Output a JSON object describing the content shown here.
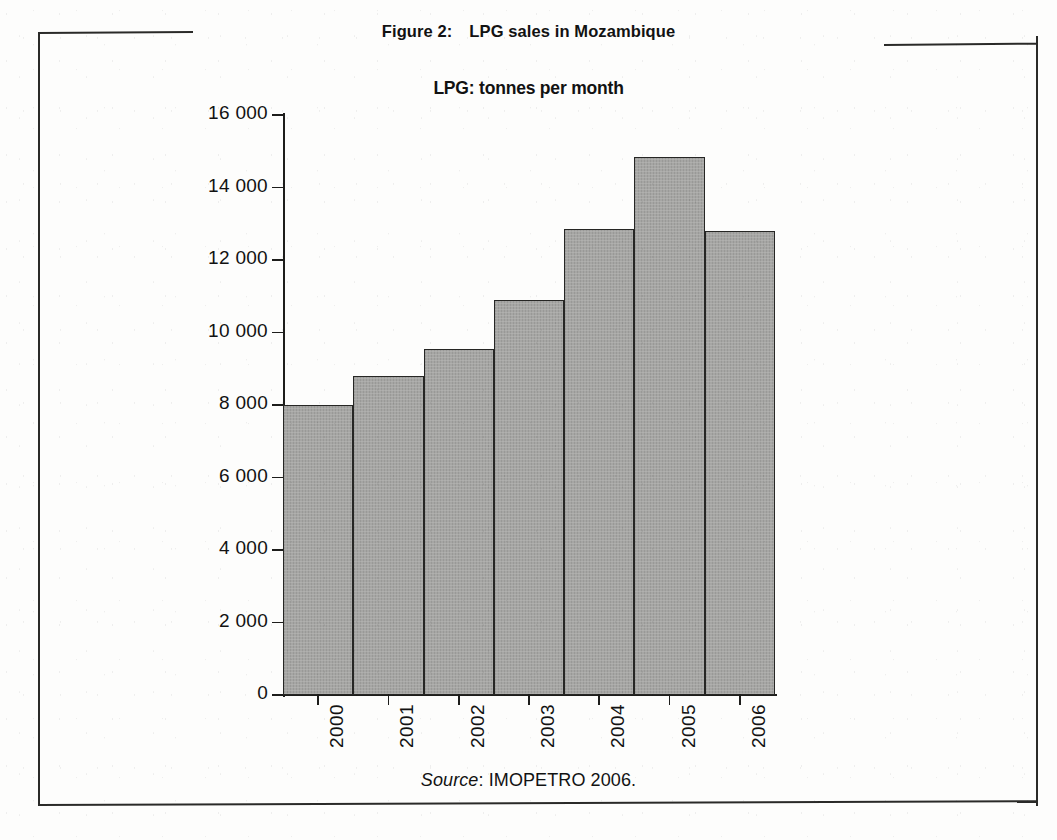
{
  "figure": {
    "number_label": "Figure 2:",
    "caption": "LPG sales in Mozambique"
  },
  "source": {
    "label": "Source",
    "text": ": IMOPETRO 2006."
  },
  "chart_data": {
    "type": "bar",
    "title": "LPG: tonnes per month",
    "xlabel": "",
    "ylabel": "",
    "categories": [
      "2000",
      "2001",
      "2002",
      "2003",
      "2004",
      "2005",
      "2006"
    ],
    "values": [
      8000,
      8800,
      9550,
      10900,
      12850,
      14850,
      12800
    ],
    "ylim": [
      0,
      16000
    ],
    "ytick_values": [
      0,
      2000,
      4000,
      6000,
      8000,
      10000,
      12000,
      14000,
      16000
    ],
    "ytick_labels": [
      "0",
      "2 000",
      "4 000",
      "6 000",
      "8 000",
      "10 000",
      "12 000",
      "14 000",
      "16 000"
    ],
    "xtick_label_rotation": -90,
    "grid": false,
    "legend": false,
    "bar_fill_color": "#a6a6a4",
    "bar_edge_color": "#262624",
    "axis_color": "#1d1d1b",
    "background_color": "#fdfdfc"
  }
}
